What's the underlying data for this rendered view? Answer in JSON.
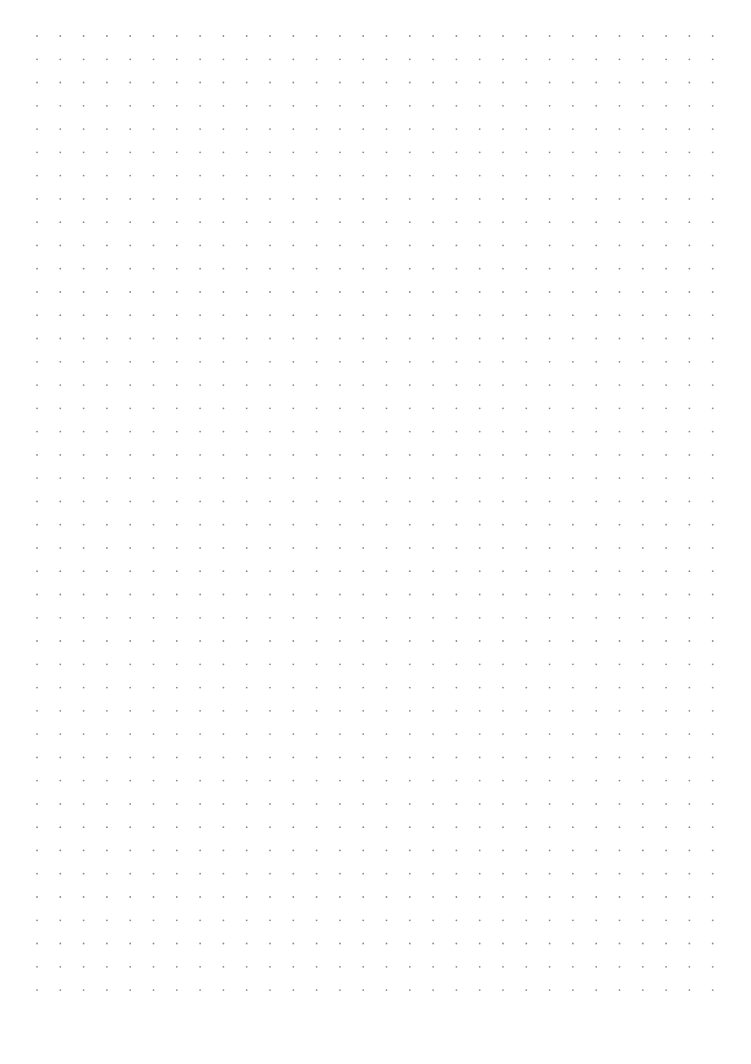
{
  "page": {
    "type": "dot-grid-paper",
    "background_color": "#ffffff",
    "dot_color": "#8a8a8a"
  },
  "grid": {
    "origin_x": 37,
    "origin_y": 36,
    "spacing_x": 23.3,
    "spacing_y": 23.27,
    "columns": 30,
    "rows": 42,
    "dot_radius": 0.9
  }
}
